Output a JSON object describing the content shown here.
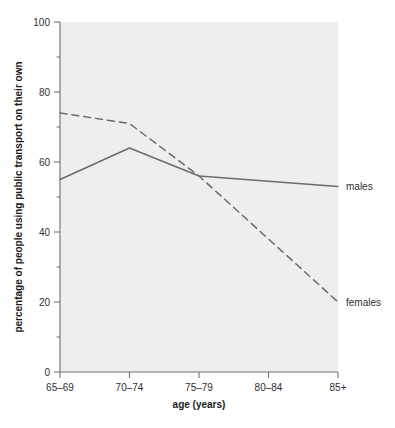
{
  "chart_data": {
    "type": "line",
    "title": "",
    "xlabel": "age (years)",
    "ylabel": "percentage of people using public transport on their own",
    "categories": [
      "65–69",
      "70–74",
      "75–79",
      "80–84",
      "85+"
    ],
    "ylim": [
      0,
      100
    ],
    "ytick_labels": [
      "0",
      "20",
      "40",
      "60",
      "80",
      "100"
    ],
    "ytick_values": [
      0,
      20,
      40,
      60,
      80,
      100
    ],
    "yminor_values": [
      10,
      30,
      50,
      70,
      90
    ],
    "grid": false,
    "legend_position": "right-inline",
    "series": [
      {
        "name": "males",
        "style": "solid",
        "color": "#6b6b6b",
        "values": [
          55,
          64,
          56,
          54.5,
          53
        ]
      },
      {
        "name": "females",
        "style": "dashed",
        "color": "#6b6b6b",
        "values": [
          74,
          71,
          56,
          38,
          20
        ]
      }
    ]
  },
  "colors": {
    "plot_background": "#eeeeee",
    "axis": "#6f6f6f",
    "line": "#6b6b6b",
    "text": "#303030"
  }
}
